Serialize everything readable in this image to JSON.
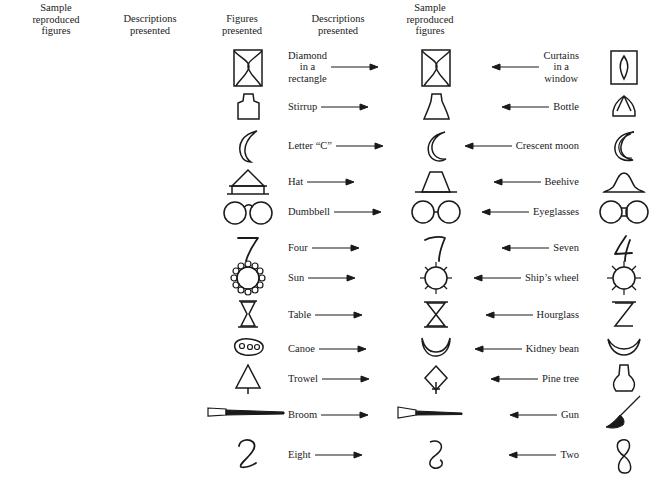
{
  "columns": {
    "sample_reproduced_left": "Sample\nreproduced\nfigures",
    "descriptions_left": "Descriptions\npresented",
    "figures": "Figures\npresented",
    "descriptions_right": "Descriptions\npresented",
    "sample_reproduced_right": "Sample\nreproduced\nfigures"
  },
  "rows": [
    {
      "stimulus": "curtains-window-figure",
      "left_label": "Curtains\nin a\nwindow",
      "right_label": "Diamond\nin a\nrectangle",
      "left_figure": "curtains-in-window",
      "center_figure": "rectangle-with-curves",
      "right_figure": "diamond-in-rectangle"
    },
    {
      "stimulus": "bottle-stirrup-figure",
      "left_label": "Bottle",
      "right_label": "Stirrup",
      "left_figure": "bottle",
      "center_figure": "trapezoid-flask",
      "right_figure": "stirrup"
    },
    {
      "stimulus": "crescent-letterc-figure",
      "left_label": "Crescent moon",
      "right_label": "Letter “C”",
      "left_figure": "crescent-moon",
      "center_figure": "crescent",
      "right_figure": "letter-c"
    },
    {
      "stimulus": "beehive-hat-figure",
      "left_label": "Beehive",
      "right_label": "Hat",
      "left_figure": "beehive",
      "center_figure": "trapezoid-on-line",
      "right_figure": "hat"
    },
    {
      "stimulus": "eyeglasses-dumbbell-figure",
      "left_label": "Eyeglasses",
      "right_label": "Dumbbell",
      "left_figure": "eyeglasses",
      "center_figure": "two-circles-joined",
      "right_figure": "dumbbell"
    },
    {
      "stimulus": "seven-four-figure",
      "left_label": "Seven",
      "right_label": "Four",
      "left_figure": "seven",
      "center_figure": "seven-like-shape",
      "right_figure": "four"
    },
    {
      "stimulus": "shipswheel-sun-figure",
      "left_label": "Ship’s wheel",
      "right_label": "Sun",
      "left_figure": "ships-wheel",
      "center_figure": "circle-with-spokes",
      "right_figure": "sun"
    },
    {
      "stimulus": "hourglass-table-figure",
      "left_label": "Hourglass",
      "right_label": "Table",
      "left_figure": "hourglass",
      "center_figure": "hourglass-outline",
      "right_figure": "table"
    },
    {
      "stimulus": "kidneybean-canoe-figure",
      "left_label": "Kidney bean",
      "right_label": "Canoe",
      "left_figure": "kidney-bean",
      "center_figure": "crescent-curve",
      "right_figure": "canoe"
    },
    {
      "stimulus": "pinetree-trowel-figure",
      "left_label": "Pine tree",
      "right_label": "Trowel",
      "left_figure": "pine-tree",
      "center_figure": "diamond-with-stem",
      "right_figure": "trowel"
    },
    {
      "stimulus": "gun-broom-figure",
      "left_label": "Gun",
      "right_label": "Broom",
      "left_figure": "gun",
      "center_figure": "tapered-line",
      "right_figure": "broom"
    },
    {
      "stimulus": "two-eight-figure",
      "left_label": "Two",
      "right_label": "Eight",
      "left_figure": "two",
      "center_figure": "curved-s-shape",
      "right_figure": "eight"
    }
  ],
  "colors": {
    "ink": "#1a1a1a",
    "background": "#ffffff"
  }
}
